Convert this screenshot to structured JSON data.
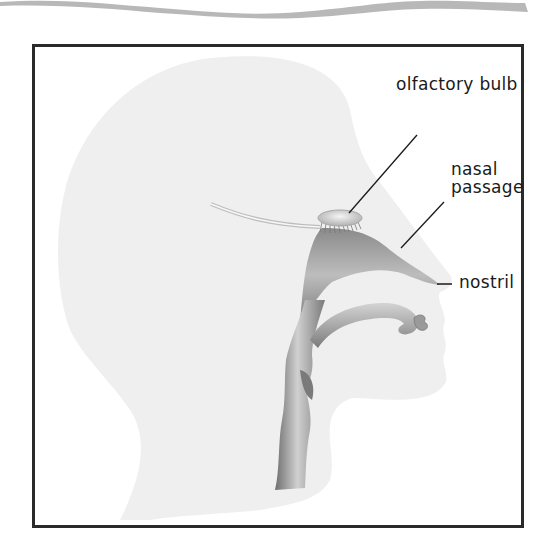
{
  "diagram": {
    "labels": {
      "olfactory_bulb": "olfactory bulb",
      "nasal_line1": "nasal",
      "nasal_line2": "passage",
      "nostril": "nostril"
    },
    "colors": {
      "frame": "#2a2a2a",
      "head_silhouette": "#efefef",
      "airway": "#8c8c8c",
      "wave_band": "#b8b8b8",
      "label_text": "#1a1a1a"
    }
  }
}
